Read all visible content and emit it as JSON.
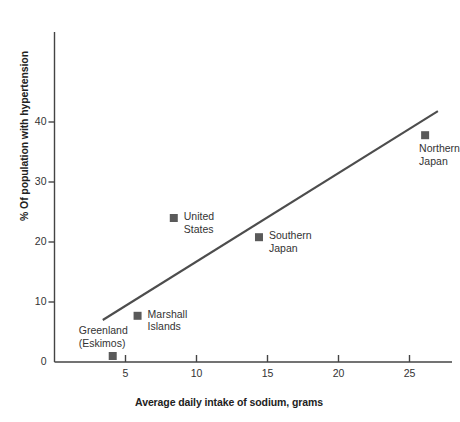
{
  "chart_data": {
    "type": "scatter",
    "title": "",
    "xlabel": "Average daily intake of sodium, grams",
    "ylabel": "% Of population with hypertension",
    "xlim": [
      0,
      27.5
    ],
    "ylim": [
      0,
      44
    ],
    "xticks": [
      5,
      10,
      15,
      20,
      25
    ],
    "yticks": [
      0,
      10,
      20,
      30,
      40
    ],
    "xtick_labels": [
      "5",
      "10",
      "15",
      "20",
      "25"
    ],
    "ytick_labels": [
      "0",
      "10",
      "20",
      "30",
      "40"
    ],
    "grid": false,
    "legend": "none",
    "marker_shape": "square",
    "marker_color": "#5a5a5a",
    "line_color": "#4d4d4d",
    "axis_color": "#444444",
    "points": [
      {
        "label": "Greenland\n(Eskimos)",
        "x": 4.1,
        "y": 1.0,
        "label_dx": -34,
        "label_dy": -32
      },
      {
        "label": "Marshall\nIslands",
        "x": 5.85,
        "y": 7.7,
        "label_dx": 10,
        "label_dy": -8
      },
      {
        "label": "United\nStates",
        "x": 8.4,
        "y": 24.0,
        "label_dx": 10,
        "label_dy": -8
      },
      {
        "label": "Southern\nJapan",
        "x": 14.4,
        "y": 20.8,
        "label_dx": 10,
        "label_dy": -8
      },
      {
        "label": "Northern\nJapan",
        "x": 26.1,
        "y": 37.8,
        "label_dx": -6,
        "label_dy": 7
      }
    ],
    "trendline": {
      "x0": 3.4,
      "y0": 7.0,
      "x1": 27.0,
      "y1": 41.8
    }
  }
}
